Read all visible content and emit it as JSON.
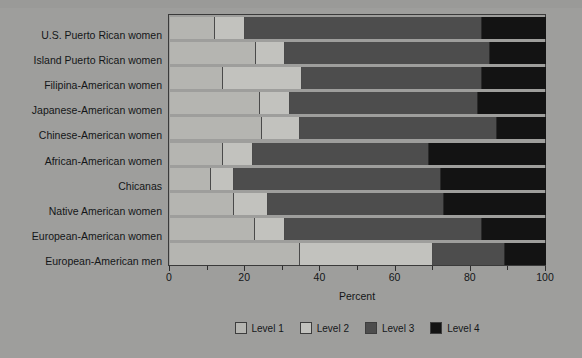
{
  "chart_data": {
    "type": "bar",
    "orientation": "horizontal",
    "stacked": true,
    "title": "",
    "xlabel": "Percent",
    "ylabel": "",
    "xlim": [
      0,
      100
    ],
    "xticks": [
      0,
      20,
      40,
      60,
      80,
      100
    ],
    "xtick_labels": [
      "0",
      "20",
      "40",
      "60",
      "80",
      "100"
    ],
    "grid": false,
    "legend_position": "bottom",
    "categories": [
      "U.S. Puerto Rican women",
      "Island Puerto Rican women",
      "Filipina-American  women",
      "Japanese-American women",
      "Chinese-American women",
      "African-American women",
      "Chicanas",
      "Native American women",
      "European-American women",
      "European-American men"
    ],
    "series": [
      {
        "name": "Level 1",
        "color": "#b5b5b1",
        "values": [
          12,
          23,
          14,
          24,
          24.5,
          14,
          11,
          17,
          22.5,
          34.5
        ]
      },
      {
        "name": "Level 2",
        "color": "#c2c2be",
        "values": [
          8,
          7.5,
          21,
          8,
          10,
          8,
          6,
          9,
          8,
          35.5
        ]
      },
      {
        "name": "Level 3",
        "color": "#4d4d4d",
        "values": [
          63,
          54.5,
          48,
          50,
          52.5,
          47,
          55,
          47,
          52.5,
          19
        ]
      },
      {
        "name": "Level 4",
        "color": "#131313",
        "values": [
          17,
          15,
          17,
          18,
          13,
          31,
          28,
          27,
          17,
          11
        ]
      }
    ]
  },
  "legend": {
    "items": [
      {
        "label": "Level 1",
        "swatch": "lvl1"
      },
      {
        "label": "Level 2",
        "swatch": "lvl2"
      },
      {
        "label": "Level 3",
        "swatch": "lvl3"
      },
      {
        "label": "Level 4",
        "swatch": "lvl4"
      }
    ]
  },
  "axis": {
    "x_title": "Percent"
  }
}
